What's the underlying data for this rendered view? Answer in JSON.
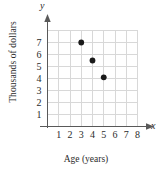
{
  "chart_data": {
    "type": "scatter",
    "title": "",
    "xlabel": "Age (years)",
    "ylabel": "Thousands of dollars",
    "x_axis_letter": "y",
    "y_axis_letter": "x",
    "xlim": [
      0,
      8
    ],
    "ylim": [
      0,
      8
    ],
    "grid": true,
    "legend": "none",
    "x_ticks": [
      1,
      2,
      3,
      4,
      5,
      6,
      7,
      8
    ],
    "y_ticks": [
      1,
      2,
      3,
      4,
      5,
      6,
      7
    ],
    "points": [
      {
        "x": 3,
        "y": 7
      },
      {
        "x": 4,
        "y": 5.5
      },
      {
        "x": 5,
        "y": 4.1
      }
    ],
    "point_color": "#1a1a1a",
    "grid_color": "#d8d8d8",
    "axis_color": "#595959"
  },
  "axes": {
    "x_letter": "x",
    "y_letter": "y",
    "x_title": "Age (years)",
    "y_title": "Thousands of dollars"
  }
}
